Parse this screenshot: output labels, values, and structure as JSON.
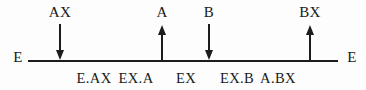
{
  "diagram": {
    "description_title": "",
    "axis": {
      "left_label": "E",
      "right_label": "E",
      "left_label_x": 18,
      "right_label_x": 352,
      "label_top": 49,
      "line_start_x": 28,
      "line_end_x": 338,
      "line_y": 60
    },
    "markers": [
      {
        "label": "AX",
        "direction": "down",
        "x": 60
      },
      {
        "label": "A",
        "direction": "up",
        "x": 162
      },
      {
        "label": "B",
        "direction": "down",
        "x": 209
      },
      {
        "label": "BX",
        "direction": "up",
        "x": 310
      }
    ],
    "segment_labels": [
      {
        "label": "E.AX",
        "x": 94
      },
      {
        "label": "EX.A",
        "x": 136
      },
      {
        "label": "EX",
        "x": 186
      },
      {
        "label": "EX.B",
        "x": 237
      },
      {
        "label": "A.BX",
        "x": 278
      }
    ]
  }
}
